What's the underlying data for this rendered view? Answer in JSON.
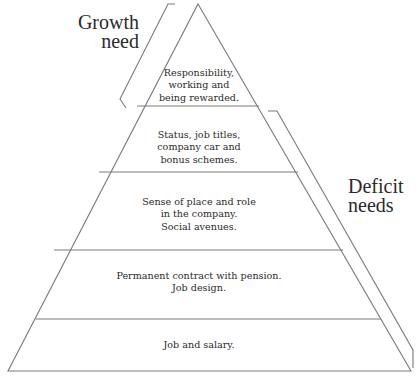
{
  "diagram": {
    "type": "pyramid",
    "colors": {
      "line": "#7a7a7a",
      "text": "#2a2a2a",
      "background": "#ffffff"
    },
    "levels": [
      {
        "id": "level-5",
        "lines": "Responsibility,\nworking and\nbeing rewarded."
      },
      {
        "id": "level-4",
        "lines": "Status, job titles,\ncompany car and\nbonus schemes."
      },
      {
        "id": "level-3",
        "lines": "Sense of place and role\nin the company.\nSocial avenues."
      },
      {
        "id": "level-2",
        "lines": "Permanent contract with pension.\nJob design."
      },
      {
        "id": "level-1",
        "lines": "Job and salary."
      }
    ],
    "brackets": {
      "growth": {
        "label": "Growth\nneed"
      },
      "deficit": {
        "label": "Deficit\nneeds"
      }
    }
  }
}
